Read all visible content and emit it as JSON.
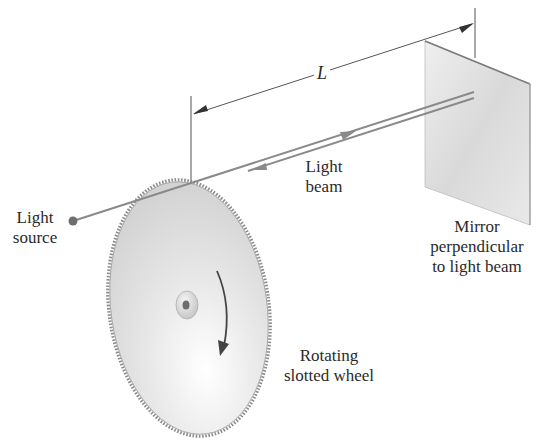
{
  "figure": {
    "colors": {
      "background": "#ffffff",
      "beam": "#8a8a8a",
      "line": "#555555",
      "text": "#2a2a2a",
      "mirror": "#e2e2e2",
      "wheel": "#e6e6e6",
      "wheel_edge": "#8c8c8c",
      "arrow": "#444444"
    }
  },
  "labels": {
    "distance": "L",
    "light_beam": [
      "Light",
      "beam"
    ],
    "light_source": [
      "Light",
      "source"
    ],
    "mirror": [
      "Mirror",
      "perpendicular",
      "to light beam"
    ],
    "wheel": [
      "Rotating",
      "slotted wheel"
    ]
  },
  "icons": {
    "beam_out_arrow": "arrow-right-icon",
    "beam_return_arrow": "arrow-left-icon",
    "rotation_arrow": "curved-arrow-down-icon"
  }
}
